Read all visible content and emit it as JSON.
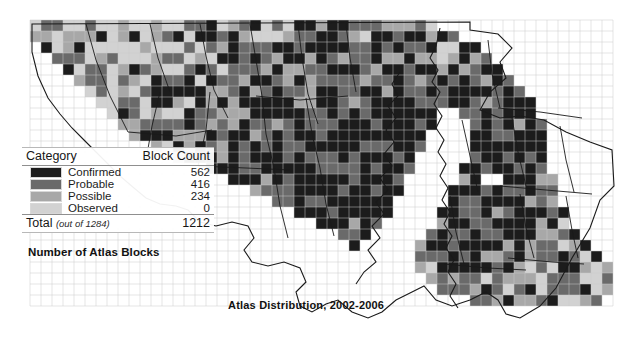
{
  "map": {
    "title": "Atlas Distribution, 2002-2006",
    "region_name": "Maryland",
    "grid": {
      "cell_size_px": 11,
      "origin_x": 30,
      "origin_y": 20,
      "cols": 53,
      "rows": 26
    },
    "palette": {
      "confirmed": "#1c1c1c",
      "probable": "#6a6a6a",
      "possible": "#a8a8a8",
      "observed": "#d2d2d2",
      "empty": "#ffffff",
      "grid_line": "#c9c9c9",
      "boundary_line": "#1a1a1a"
    }
  },
  "legend": {
    "header": {
      "category": "Category",
      "block_count": "Block Count"
    },
    "rows": [
      {
        "label": "Confirmed",
        "count": "562",
        "color": "#1c1c1c"
      },
      {
        "label": "Probable",
        "count": "416",
        "color": "#6a6a6a"
      },
      {
        "label": "Possible",
        "count": "234",
        "color": "#a8a8a8"
      },
      {
        "label": "Observed",
        "count": "0",
        "color": "#d2d2d2"
      }
    ],
    "total": {
      "label": "Total",
      "sublabel": "(out of 1284)",
      "count": "1212"
    },
    "caption": "Number of Atlas Blocks"
  },
  "chart_data": {
    "type": "map",
    "title": "Atlas Distribution, 2002-2006",
    "categories": [
      "Confirmed",
      "Probable",
      "Possible",
      "Observed"
    ],
    "values": [
      562,
      416,
      234,
      0
    ],
    "total": 1212,
    "total_possible": 1284,
    "ylabel": "Number of Atlas Blocks",
    "legend_position": "left"
  }
}
